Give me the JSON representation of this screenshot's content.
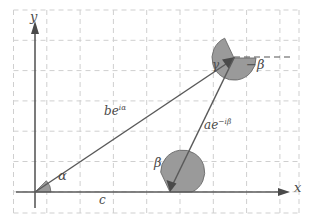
{
  "figure": {
    "type": "geometry-diagram",
    "title": "",
    "axes": {
      "x_label": "x",
      "y_label": "y",
      "origin": [
        35,
        192
      ]
    },
    "grid": {
      "style": "dashed",
      "color": "#cfcfcf",
      "x_spacing": 33.3,
      "y_spacing": 30.3
    },
    "colors": {
      "line": "#5a5a5a",
      "wedge_fill": "#9a9a9a",
      "wedge_stroke": "#6b6b6b",
      "grid": "#cfcfcf",
      "text": "#4a4a4a",
      "background": "#ffffff"
    },
    "vertices": [
      {
        "name": "origin",
        "x": 35,
        "y": 192
      },
      {
        "name": "c-point",
        "x": 170,
        "y": 192
      },
      {
        "name": "apex",
        "x": 234,
        "y": 58
      }
    ],
    "angle_labels": [
      {
        "name": "alpha",
        "text": "α",
        "x": 58,
        "y": 176
      },
      {
        "name": "beta",
        "text": "β",
        "x": 154,
        "y": 163
      },
      {
        "name": "gamma",
        "text": "γ",
        "x": 214,
        "y": 65
      },
      {
        "name": "minus-beta",
        "text": "−β",
        "x": 247,
        "y": 64
      }
    ],
    "side_labels": [
      {
        "name": "side-b",
        "base": "be",
        "exp": "iα",
        "x": 104,
        "y": 110
      },
      {
        "name": "side-a",
        "base": "ae",
        "exp": "−iβ",
        "x": 204,
        "y": 124
      },
      {
        "name": "side-c",
        "base": "c",
        "exp": "",
        "x": 99,
        "y": 193
      }
    ],
    "annotations": {
      "dashed_ray_from_apex": "horizontal reference line to the right of apex"
    }
  }
}
